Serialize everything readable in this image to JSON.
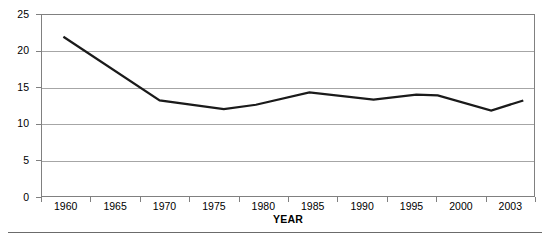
{
  "chart_data": {
    "type": "line",
    "title": "",
    "xlabel": "YEAR",
    "ylabel": "POVERTY RATE",
    "xlim": [
      1958,
      2004
    ],
    "ylim": [
      0,
      25
    ],
    "grid": true,
    "legend": false,
    "y_ticks": [
      25,
      20,
      15,
      10,
      5,
      0
    ],
    "x_tick_labels": [
      "1960",
      "1965",
      "1970",
      "1975",
      "1980",
      "1985",
      "1990",
      "1995",
      "2000",
      "2003"
    ],
    "series": [
      {
        "name": "Poverty rate",
        "color": "#1a1a1a",
        "x": [
          1960,
          1969,
          1975,
          1978,
          1983,
          1989,
          1993,
          1995,
          2000,
          2003
        ],
        "values": [
          22.0,
          13.2,
          12.0,
          12.6,
          14.3,
          13.3,
          14.0,
          13.9,
          11.8,
          13.2
        ]
      }
    ]
  },
  "axes": {
    "y_title": "POVERTY RATE",
    "x_title": "YEAR",
    "y_tick_labels": [
      "25",
      "20",
      "15",
      "10",
      "5",
      "0"
    ],
    "x_tick_labels": [
      "1960",
      "1965",
      "1970",
      "1975",
      "1980",
      "1985",
      "1990",
      "1995",
      "2000",
      "2003"
    ]
  },
  "colors": {
    "line": "#1a1a1a",
    "gridline": "#a6a6a6",
    "border": "#808080",
    "background": "#ffffff",
    "text": "#000000"
  }
}
